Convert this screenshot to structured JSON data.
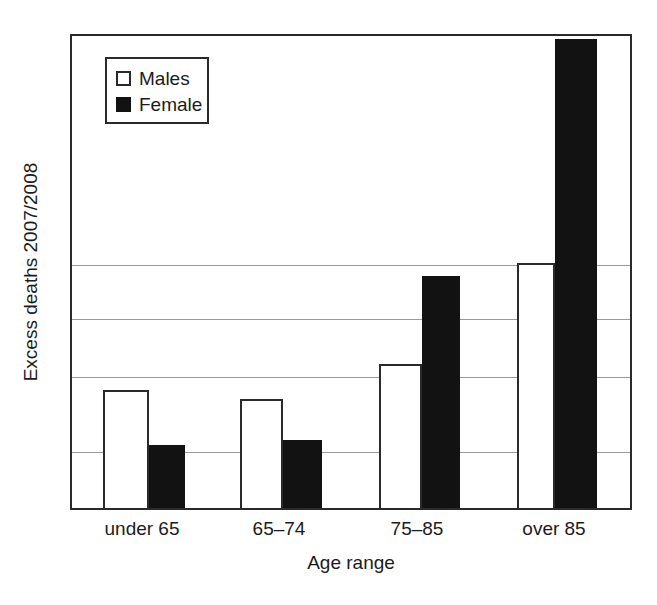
{
  "chart_data": {
    "type": "bar",
    "title": "",
    "xlabel": "Age range",
    "ylabel": "Excess deaths 2007/2008",
    "categories": [
      "under 65",
      "65–74",
      "75–85",
      "over 85"
    ],
    "series": [
      {
        "name": "Males",
        "color": "#ffffff",
        "edge_color": "#2a2a2a",
        "values": [
          0.248,
          0.229,
          0.303,
          0.515
        ]
      },
      {
        "name": "Female",
        "color": "#121212",
        "edge_color": "#121212",
        "values": [
          0.132,
          0.143,
          0.487,
          0.985
        ]
      }
    ],
    "ylim": [
      0,
      1
    ],
    "y_tick_labels": [],
    "gridlines": [
      0.115,
      0.273,
      0.395,
      0.508
    ],
    "grid": true,
    "legend_position": "upper-left",
    "axis_color": "#2a2a2a",
    "grid_color": "#9a9a9a",
    "background": "#ffffff",
    "note": "Y axis is unlabelled; bar values are fractions of the plot height read off the image."
  },
  "legend": {
    "items": [
      {
        "label": "Males",
        "style": "open-square"
      },
      {
        "label": "Female",
        "style": "filled-square"
      }
    ]
  },
  "axes": {
    "y_title": "Excess deaths 2007/2008",
    "x_title": "Age range"
  }
}
